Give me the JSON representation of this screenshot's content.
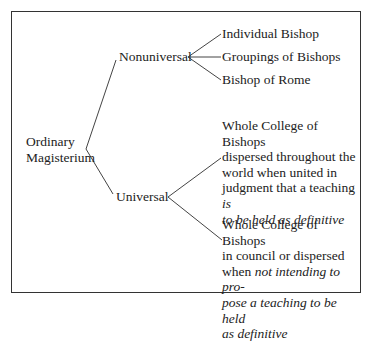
{
  "root": {
    "line1": "Ordinary",
    "line2": "Magisterium"
  },
  "nonuniversal": {
    "label": "Nonuniversal",
    "children": [
      "Individual Bishop",
      "Groupings of Bishops",
      "Bishop of Rome"
    ]
  },
  "universal": {
    "label": "Universal",
    "children": [
      {
        "l1": "Whole College of Bishops",
        "l2": "dispersed throughout the",
        "l3": "world when united in",
        "l4a": "judgment that a teaching ",
        "l4b": "is",
        "l5": "to be held as definitive"
      },
      {
        "l1": "Whole College of Bishops",
        "l2": "in council or dispersed",
        "l3a": "when ",
        "l3b": "not intending to pro-",
        "l4": "pose a teaching to be held",
        "l5": "as definitive"
      }
    ]
  }
}
